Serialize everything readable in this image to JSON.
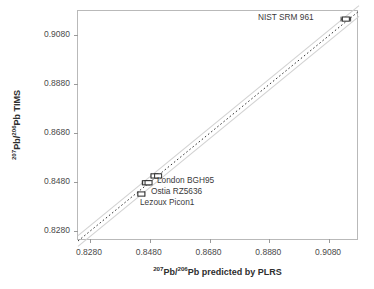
{
  "chart_data": {
    "type": "scatter",
    "title": "",
    "xlabel_parts": {
      "sup1": "207",
      "mid": "Pb/",
      "sup2": "206",
      "tail": "Pb predicted by PLRS"
    },
    "ylabel_parts": {
      "sup1": "207",
      "mid": "Pb/",
      "sup2": "206",
      "tail": "Pb TIMS"
    },
    "xlabel": "207Pb/206Pb predicted by PLRS",
    "ylabel": "207Pb/206Pb TIMS",
    "xlim": [
      0.824,
      0.918
    ],
    "ylim": [
      0.824,
      0.918
    ],
    "xticks": [
      "0.8280",
      "0.8480",
      "0.8680",
      "0.8880",
      "0.9080"
    ],
    "yticks": [
      "0.8280",
      "0.8480",
      "0.8680",
      "0.8880",
      "0.9080"
    ],
    "xtick_values": [
      0.828,
      0.848,
      0.868,
      0.888,
      0.908
    ],
    "ytick_values": [
      0.828,
      0.848,
      0.868,
      0.888,
      0.908
    ],
    "grid": false,
    "legend": "none",
    "marker_style": "open-rectangle-with-horizontal-error-bars",
    "identity_line": {
      "style": "dotted",
      "color": "#333333",
      "from": [
        0.824,
        0.824
      ],
      "to": [
        0.918,
        0.918
      ],
      "label": "1:1 line"
    },
    "confidence_band": {
      "style": "solid",
      "color": "#d2d2d2",
      "offset": 0.0022,
      "label": "confidence band"
    },
    "points": [
      {
        "name": "Lezoux Picon1",
        "x": 0.8452,
        "y": 0.8432,
        "xerr": 0.0011,
        "labelled": true
      },
      {
        "name": "Ostia RZ5636",
        "x": 0.8468,
        "y": 0.8478,
        "xerr": 0.0013,
        "labelled": true
      },
      {
        "name": "unlabelled-a",
        "x": 0.8476,
        "y": 0.8478,
        "xerr": 0.0008,
        "labelled": false
      },
      {
        "name": "London BGH95",
        "x": 0.8496,
        "y": 0.8506,
        "xerr": 0.0011,
        "labelled": true
      },
      {
        "name": "unlabelled-b",
        "x": 0.8508,
        "y": 0.8506,
        "xerr": 0.0008,
        "labelled": false
      },
      {
        "name": "NIST SRM 961",
        "x": 0.9136,
        "y": 0.9147,
        "xerr": 0.0016,
        "labelled": true
      }
    ],
    "annotations": [
      {
        "text": "NIST SRM 961",
        "x_px": 258,
        "y_px": 13
      },
      {
        "text": "London BGH95",
        "x_px": 157,
        "y_px": 176
      },
      {
        "text": "Ostia RZ5636",
        "x_px": 151,
        "y_px": 187
      },
      {
        "text": "Lezoux Picon1",
        "x_px": 140,
        "y_px": 198
      }
    ]
  },
  "colors": {
    "frame": "#b9b9b9",
    "tick": "#9a9a9a",
    "text": "#3a3a3a",
    "axis_title": "#2e2e2e",
    "identity_line": "#333333",
    "band": "#d2d2d2",
    "marker_stroke": "#2b2b2b",
    "background": "#ffffff"
  }
}
